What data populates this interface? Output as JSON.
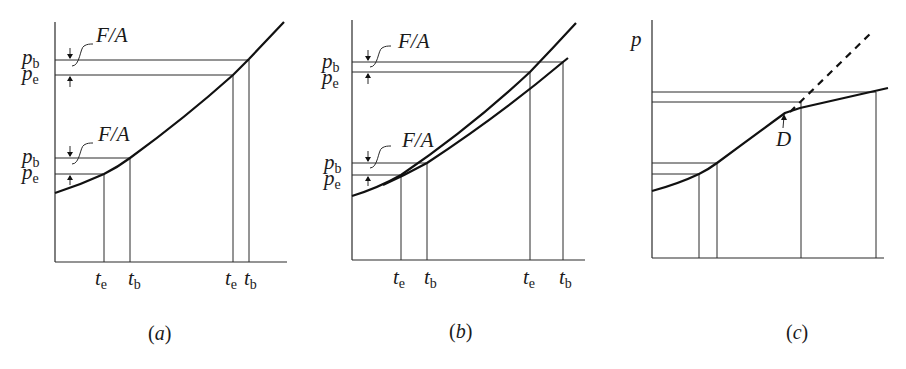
{
  "figure": {
    "panels": [
      {
        "id": "a",
        "caption": "(a)",
        "caption_letter": "a",
        "y_labels": [
          {
            "sym": "p",
            "sub": "b"
          },
          {
            "sym": "p",
            "sub": "e"
          },
          {
            "sym": "p",
            "sub": "b"
          },
          {
            "sym": "p",
            "sub": "e"
          }
        ],
        "x_labels": [
          {
            "sym": "t",
            "sub": "e"
          },
          {
            "sym": "t",
            "sub": "b"
          },
          {
            "sym": "t",
            "sub": "e"
          },
          {
            "sym": "t",
            "sub": "b"
          }
        ],
        "annotations": [
          "F/A",
          "F/A"
        ]
      },
      {
        "id": "b",
        "caption": "(b)",
        "caption_letter": "b",
        "y_labels": [
          {
            "sym": "p",
            "sub": "b"
          },
          {
            "sym": "p",
            "sub": "e"
          },
          {
            "sym": "p",
            "sub": "b"
          },
          {
            "sym": "p",
            "sub": "e"
          }
        ],
        "x_labels": [
          {
            "sym": "t",
            "sub": "e"
          },
          {
            "sym": "t",
            "sub": "b"
          },
          {
            "sym": "t",
            "sub": "e"
          },
          {
            "sym": "t",
            "sub": "b"
          }
        ],
        "annotations": [
          "F/A",
          "F/A"
        ]
      },
      {
        "id": "c",
        "caption": "(c)",
        "caption_letter": "c",
        "y_axis_label": "p",
        "point_label": "D"
      }
    ]
  }
}
